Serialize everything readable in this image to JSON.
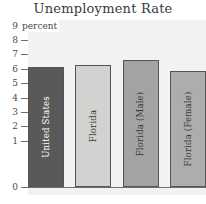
{
  "chart_data": {
    "type": "bar",
    "title": "Unemployment Rate",
    "xlabel": "",
    "ylabel": "percent",
    "ylim": [
      0,
      9
    ],
    "yticks": [
      "9",
      "8",
      "7",
      "6",
      "5",
      "4",
      "3",
      "2",
      "1",
      "0"
    ],
    "grid": true,
    "legend": false,
    "categories": [
      "United States",
      "Florida",
      "Florida (Male)",
      "Florida (Female)"
    ],
    "values": [
      6.7,
      6.8,
      7.1,
      6.5
    ],
    "bar_colors": [
      "#595959",
      "#d2d2d0",
      "#a3a3a1",
      "#adadab"
    ],
    "bar_label_colors": [
      "#ffffff",
      "#3a3a3a",
      "#3a3a3a",
      "#3a3a3a"
    ],
    "plot_background": "#f2f2f0",
    "axis_color": "#6e6e6e"
  },
  "axis": {
    "ticks": [
      {
        "label": "9"
      },
      {
        "label": "8"
      },
      {
        "label": "7"
      },
      {
        "label": "6"
      },
      {
        "label": "5"
      },
      {
        "label": "4"
      },
      {
        "label": "3"
      },
      {
        "label": "2"
      },
      {
        "label": "1"
      },
      {
        "label": "0"
      }
    ],
    "unit_caption": "percent"
  }
}
